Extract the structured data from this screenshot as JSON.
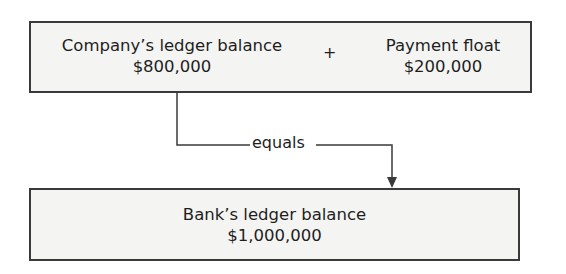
{
  "diagram": {
    "top": {
      "left_term": {
        "label": "Company’s ledger balance",
        "value": "$800,000"
      },
      "operator": "+",
      "right_term": {
        "label": "Payment float",
        "value": "$200,000"
      }
    },
    "connector": {
      "label": "equals"
    },
    "bottom": {
      "label": "Bank’s ledger balance",
      "value": "$1,000,000"
    }
  },
  "colors": {
    "border": "#3a3a3a",
    "box_fill": "#f4f4f2",
    "text": "#1e1e1e"
  }
}
